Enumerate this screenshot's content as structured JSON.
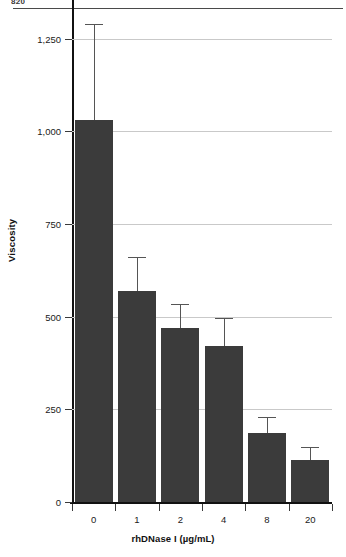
{
  "page": {
    "number": "820"
  },
  "chart_data": {
    "type": "bar",
    "title": "",
    "xlabel": "rhDNase I (µg/mL)",
    "ylabel": "Viscosity",
    "categories": [
      "0",
      "1",
      "2",
      "4",
      "8",
      "20"
    ],
    "values": [
      1030,
      570,
      470,
      420,
      185,
      112
    ],
    "errors_upper": [
      1290,
      660,
      535,
      495,
      228,
      148
    ],
    "error_type": "upper-only-whisker",
    "ylim": [
      0,
      1300
    ],
    "yticks": [
      0,
      250,
      500,
      750,
      1000,
      1250
    ],
    "ytick_labels": [
      "0",
      "250",
      "500",
      "750",
      "1,000",
      "1,250"
    ],
    "grid": true,
    "legend": "none",
    "bar_color": "#3b3b3b",
    "gridline_color": "#c9c9c9",
    "axis_color": "#111111"
  }
}
